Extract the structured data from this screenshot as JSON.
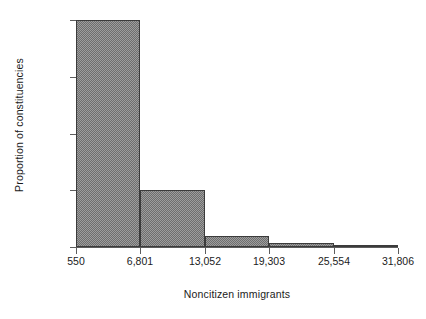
{
  "chart_data": {
    "type": "bar",
    "title": "",
    "subtitle": "",
    "xlabel": "Noncitizen immigrants",
    "ylabel": "Proportion of constituencies",
    "grid": false,
    "legend": null,
    "legend_position": "none",
    "bin_edges": [
      550,
      6801,
      13052,
      19303,
      25554,
      31806
    ],
    "categories": [
      "550-6,801",
      "6,801-13,052",
      "13,052-19,303",
      "19,303-25,554",
      "25,554-31,806"
    ],
    "values": [
      0.728,
      0.182,
      0.036,
      0.014,
      0.007
    ],
    "xlim": [
      550,
      31806
    ],
    "ylim": [
      0.0,
      0.728
    ],
    "xticks": [
      550,
      6801,
      13052,
      19303,
      25554,
      31806
    ],
    "xtick_labels": [
      "550",
      "6,801",
      "13,052",
      "19,303",
      "25,554",
      "31,806"
    ],
    "yticks": [
      0.0,
      0.182,
      0.364,
      0.546,
      0.728
    ],
    "ytick_labels": [
      "0.0",
      "",
      "",
      "",
      "0.728"
    ],
    "annotations": []
  },
  "axes": {
    "y_label": "Proportion of constituencies",
    "x_label": "Noncitizen immigrants",
    "y_tick_top": "0.728",
    "y_tick_bottom": "0.0"
  },
  "colors": {
    "bar_fill": "#9d9d9d",
    "bar_hatch": "#6e6e6e",
    "bar_border": "#3b3b3b",
    "axis": "#5d5d5d",
    "text": "#1b1b1b",
    "background": "#ffffff"
  }
}
